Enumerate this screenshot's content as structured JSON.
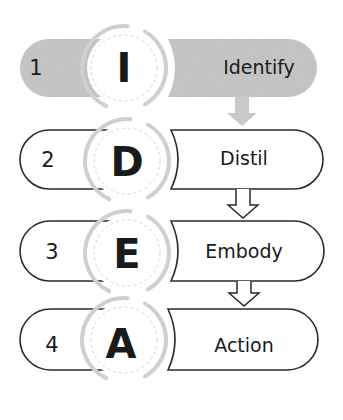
{
  "colors": {
    "active_fill": "#c9c9c9",
    "outline": "#2a2a2a",
    "ring": "#cfcfcf",
    "dashed_ring": "#d6d6d6",
    "text": "#1a1a1a",
    "background": "#ffffff"
  },
  "steps": [
    {
      "number": "1",
      "letter": "I",
      "label": "Identify",
      "active": true,
      "top": 39,
      "bottom": 97,
      "right": 317,
      "cx": 124,
      "cy": 68
    },
    {
      "number": "2",
      "letter": "D",
      "label": "Distil",
      "active": false,
      "top": 130,
      "bottom": 189,
      "right": 323,
      "cx": 127,
      "cy": 161
    },
    {
      "number": "3",
      "letter": "E",
      "label": "Embody",
      "active": false,
      "top": 221,
      "bottom": 281,
      "right": 324,
      "cx": 127,
      "cy": 253
    },
    {
      "number": "4",
      "letter": "A",
      "label": "Action",
      "active": false,
      "top": 309,
      "bottom": 370,
      "right": 318,
      "cx": 124,
      "cy": 340
    }
  ],
  "arrows": [
    {
      "from": 1,
      "to": 2,
      "style": "filled-grey",
      "x": 242,
      "top": 97,
      "tip": 126
    },
    {
      "from": 2,
      "to": 3,
      "style": "outline",
      "x": 243,
      "top": 189,
      "tip": 218
    },
    {
      "from": 3,
      "to": 4,
      "style": "outline",
      "x": 244,
      "top": 281,
      "tip": 306
    }
  ]
}
